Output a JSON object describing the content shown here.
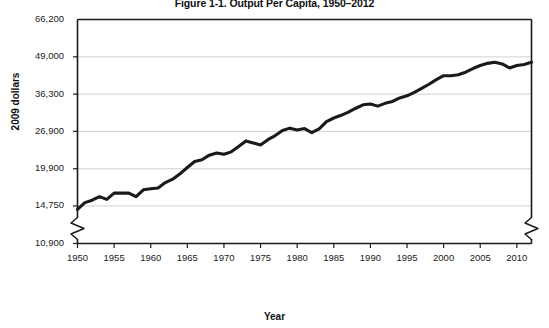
{
  "chart_data": {
    "type": "line",
    "title": "Figure 1-1. Output Per Capita, 1950–2012",
    "xlabel": "Year",
    "ylabel": "2009 dollars",
    "grid": true,
    "legend": "none",
    "yscale": "log",
    "ylim": [
      10900,
      66200
    ],
    "xlim": [
      1950,
      2012
    ],
    "ytick_labels": [
      "66,200",
      "49,000",
      "36,300",
      "26,900",
      "19,900",
      "14,750",
      "10,900"
    ],
    "ytick_values": [
      66200,
      49000,
      36300,
      26900,
      19900,
      14750,
      10900
    ],
    "xtick_labels": [
      "1950",
      "1955",
      "1960",
      "1965",
      "1970",
      "1975",
      "1980",
      "1985",
      "1990",
      "1995",
      "2000",
      "2005",
      "2010"
    ],
    "xtick_values": [
      1950,
      1955,
      1960,
      1965,
      1970,
      1975,
      1980,
      1985,
      1990,
      1995,
      2000,
      2005,
      2010
    ],
    "axis_break": "zigzag-bottom-both-axes",
    "line_color": "#1a1a1a",
    "grid_color": "#cccccc",
    "series": [
      {
        "name": "Output per capita",
        "x": [
          1950,
          1951,
          1952,
          1953,
          1954,
          1955,
          1956,
          1957,
          1958,
          1959,
          1960,
          1961,
          1962,
          1963,
          1964,
          1965,
          1966,
          1967,
          1968,
          1969,
          1970,
          1971,
          1972,
          1973,
          1974,
          1975,
          1976,
          1977,
          1978,
          1979,
          1980,
          1981,
          1982,
          1983,
          1984,
          1985,
          1986,
          1987,
          1988,
          1989,
          1990,
          1991,
          1992,
          1993,
          1994,
          1995,
          1996,
          1997,
          1998,
          1999,
          2000,
          2001,
          2002,
          2003,
          2004,
          2005,
          2006,
          2007,
          2008,
          2009,
          2010,
          2011,
          2012
        ],
        "values": [
          14350,
          15150,
          15450,
          15900,
          15550,
          16350,
          16350,
          16350,
          15900,
          16800,
          16950,
          17050,
          17800,
          18300,
          19100,
          20100,
          21100,
          21400,
          22200,
          22600,
          22350,
          22800,
          23800,
          24900,
          24500,
          24100,
          25150,
          26000,
          27100,
          27600,
          27200,
          27500,
          26600,
          27450,
          29100,
          29950,
          30600,
          31400,
          32400,
          33300,
          33500,
          32950,
          33700,
          34200,
          35200,
          35800,
          36800,
          38000,
          39300,
          40800,
          42100,
          42100,
          42400,
          43300,
          44600,
          45700,
          46500,
          46900,
          46300,
          44800,
          45700,
          46100,
          46900
        ]
      }
    ],
    "annotations": []
  }
}
